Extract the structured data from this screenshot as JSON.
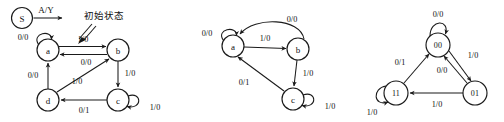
{
  "figure": {
    "background_color": "#ffffff",
    "stroke_color": "#1a1a1a",
    "width": 504,
    "height": 122,
    "panel_count": 3
  },
  "panel1": {
    "name": "mealy-state-diagram-abcd",
    "start_node": {
      "label": "S",
      "transition_label": "A/Y"
    },
    "annotation": {
      "text": "初始状态",
      "points_to": "a"
    },
    "nodes": [
      {
        "id": "a",
        "label": "a"
      },
      {
        "id": "b",
        "label": "b"
      },
      {
        "id": "c",
        "label": "c"
      },
      {
        "id": "d",
        "label": "d"
      }
    ],
    "edges": [
      {
        "from": "a",
        "to": "a",
        "label": "0/0",
        "kind": "self-loop"
      },
      {
        "from": "a",
        "to": "b",
        "label": "1/0",
        "kind": "straight"
      },
      {
        "from": "b",
        "to": "a",
        "label": "0/0",
        "kind": "straight"
      },
      {
        "from": "b",
        "to": "c",
        "label": "1/0",
        "kind": "straight"
      },
      {
        "from": "c",
        "to": "c",
        "label": "1/0",
        "kind": "self-loop"
      },
      {
        "from": "c",
        "to": "d",
        "label": "0/1",
        "kind": "straight"
      },
      {
        "from": "d",
        "to": "a",
        "label": "0/0",
        "kind": "straight"
      },
      {
        "from": "d",
        "to": "b",
        "label": "1/0",
        "kind": "diagonal"
      }
    ]
  },
  "panel2": {
    "name": "mealy-state-diagram-abc",
    "nodes": [
      {
        "id": "a",
        "label": "a"
      },
      {
        "id": "b",
        "label": "b"
      },
      {
        "id": "c",
        "label": "c"
      }
    ],
    "edges": [
      {
        "from": "a",
        "to": "a",
        "label": "0/0",
        "kind": "self-loop"
      },
      {
        "from": "a",
        "to": "b",
        "label": "1/0",
        "kind": "straight"
      },
      {
        "from": "b",
        "to": "a",
        "label": "0/0",
        "kind": "curved"
      },
      {
        "from": "b",
        "to": "c",
        "label": "1/0",
        "kind": "straight"
      },
      {
        "from": "c",
        "to": "c",
        "label": "1/0",
        "kind": "self-loop"
      },
      {
        "from": "c",
        "to": "a",
        "label": "0/1",
        "kind": "diagonal"
      }
    ]
  },
  "panel3": {
    "name": "mealy-state-diagram-binary",
    "nodes": [
      {
        "id": "00",
        "label": "00"
      },
      {
        "id": "11",
        "label": "11"
      },
      {
        "id": "01",
        "label": "01"
      }
    ],
    "edges": [
      {
        "from": "00",
        "to": "00",
        "label": "0/0",
        "kind": "self-loop"
      },
      {
        "from": "00",
        "to": "01",
        "label": "1/0",
        "kind": "diagonal"
      },
      {
        "from": "01",
        "to": "00",
        "label": "0/0",
        "kind": "diagonal"
      },
      {
        "from": "01",
        "to": "11",
        "label": "1/0",
        "kind": "straight"
      },
      {
        "from": "11",
        "to": "00",
        "label": "0/1",
        "kind": "diagonal"
      },
      {
        "from": "11",
        "to": "11",
        "label": "1/0",
        "kind": "self-loop"
      }
    ]
  }
}
